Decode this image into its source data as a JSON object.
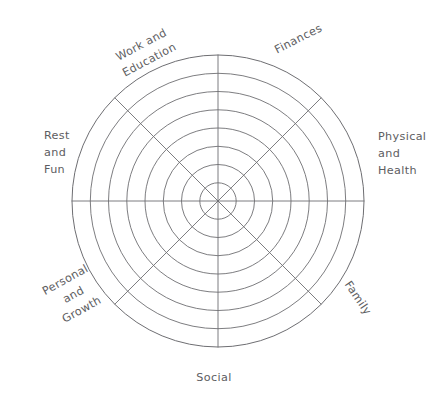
{
  "diagram": {
    "type": "radar-grid-template",
    "background_color": "#ffffff",
    "stroke_color": "#6e6e72",
    "label_color": "#5d5d61",
    "center": {
      "x": 218,
      "y": 201
    },
    "outer_radius": 146,
    "ring_count": 8,
    "spoke_count": 8,
    "ring_radii": [
      18.2,
      36.5,
      54.7,
      73.0,
      91.2,
      109.5,
      127.7,
      146.0
    ],
    "axes": [
      {
        "id": "finances",
        "label": "Finances",
        "lines": [
          "Finances"
        ],
        "angle_deg": 22.5,
        "label_rotation_deg": -27,
        "label_x": 300,
        "label_y": 42,
        "anchor": "middle"
      },
      {
        "id": "physical-and-health",
        "label": "Physical and Health",
        "lines": [
          "Physical",
          "and",
          "Health"
        ],
        "angle_deg": 67.5,
        "label_rotation_deg": 0,
        "label_x": 378,
        "label_y": 140,
        "anchor": "start"
      },
      {
        "id": "family",
        "label": "Family",
        "lines": [
          "Family"
        ],
        "angle_deg": 112.5,
        "label_rotation_deg": 56,
        "label_x": 355,
        "label_y": 300,
        "anchor": "middle"
      },
      {
        "id": "social",
        "label": "Social",
        "lines": [
          "Social"
        ],
        "angle_deg": 157.5,
        "label_rotation_deg": 0,
        "label_x": 214,
        "label_y": 381,
        "anchor": "middle"
      },
      {
        "id": "personal-and-growth",
        "label": "Personal and Growth",
        "lines": [
          "Personal",
          "and",
          "Growth"
        ],
        "angle_deg": 202.5,
        "label_rotation_deg": -29,
        "label_x": 67,
        "label_y": 283,
        "anchor": "middle"
      },
      {
        "id": "rest-and-fun",
        "label": "Rest and Fun",
        "lines": [
          "Rest",
          "and",
          "Fun"
        ],
        "angle_deg": 247.5,
        "label_rotation_deg": 0,
        "label_x": 44,
        "label_y": 139,
        "anchor": "start"
      },
      {
        "id": "work-and-education",
        "label": "Work and Education",
        "lines": [
          "Work and",
          "Education"
        ],
        "angle_deg": 292.5,
        "label_rotation_deg": -28,
        "label_x": 143,
        "label_y": 48,
        "anchor": "middle"
      }
    ],
    "label_line_height": 17
  }
}
